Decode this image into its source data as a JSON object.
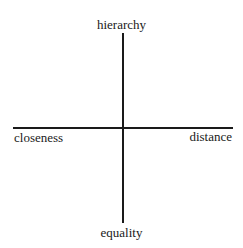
{
  "diagram": {
    "type": "quadrant-axes",
    "axes": {
      "vertical": {
        "top": "hierarchy",
        "bottom": "equality"
      },
      "horizontal": {
        "left": "closeness",
        "right": "distance"
      }
    },
    "colors": {
      "line": "#1a1a1a",
      "text": "#1a1a1a",
      "background": "#ffffff"
    }
  }
}
